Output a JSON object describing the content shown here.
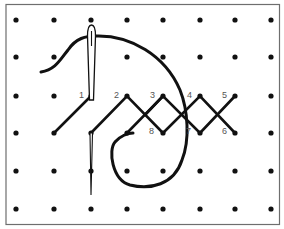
{
  "diagram": {
    "type": "cross-stitch embroidery instruction",
    "colors": {
      "background": "#ffffff",
      "border": "#6e6e6e",
      "dot": "#111111",
      "thread": "#111111",
      "label": "#555555"
    },
    "grid": {
      "columns_x": [
        16,
        54,
        91,
        127,
        163,
        200,
        235,
        271
      ],
      "rows_y": [
        20,
        57,
        96,
        133,
        171,
        209
      ]
    },
    "stitch_labels": [
      {
        "text": "1",
        "x": 79,
        "y": 98
      },
      {
        "text": "2",
        "x": 114,
        "y": 98
      },
      {
        "text": "3",
        "x": 150,
        "y": 98
      },
      {
        "text": "4",
        "x": 187,
        "y": 98
      },
      {
        "text": "5",
        "x": 222,
        "y": 98
      },
      {
        "text": "6",
        "x": 222,
        "y": 134
      },
      {
        "text": "7",
        "x": 186,
        "y": 134
      },
      {
        "text": "8",
        "x": 149,
        "y": 134
      }
    ],
    "elements": [
      "needle",
      "thread",
      "zigzag-stitches"
    ]
  }
}
